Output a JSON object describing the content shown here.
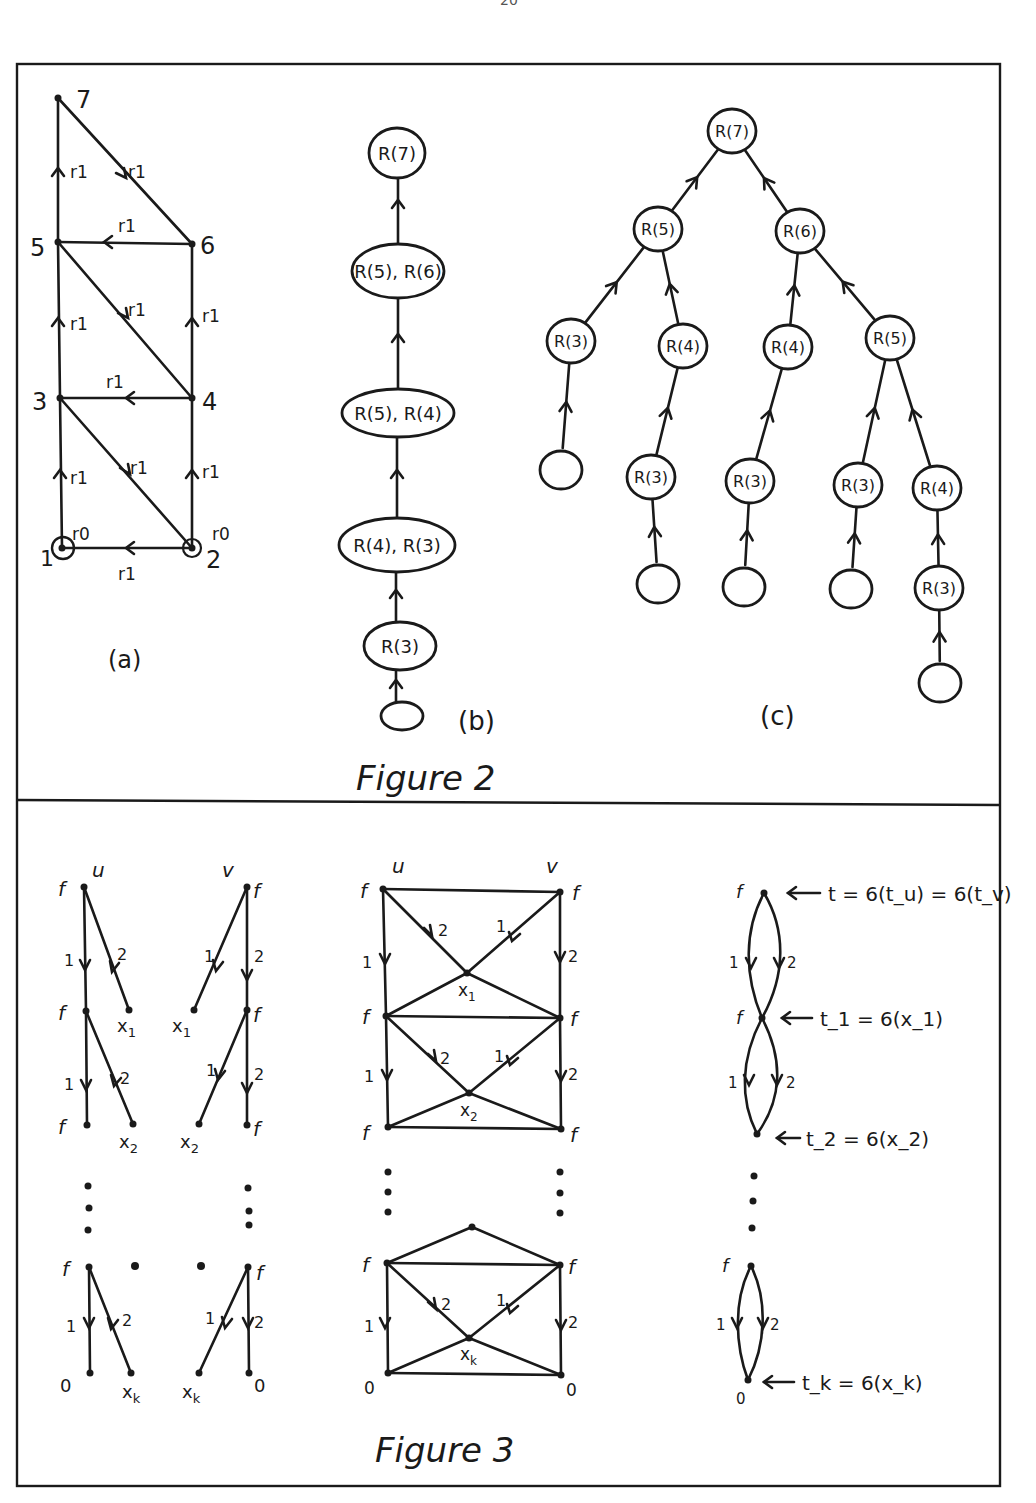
{
  "page_number": "20",
  "figure2": {
    "caption": "Figure 2",
    "a": {
      "label": "(a)",
      "nodes": [
        {
          "id": "1",
          "x": 62,
          "y": 548
        },
        {
          "id": "2",
          "x": 192,
          "y": 548
        },
        {
          "id": "3",
          "x": 60,
          "y": 398
        },
        {
          "id": "4",
          "x": 192,
          "y": 398
        },
        {
          "id": "5",
          "x": 58,
          "y": 242
        },
        {
          "id": "6",
          "x": 192,
          "y": 244
        },
        {
          "id": "7",
          "x": 58,
          "y": 98
        }
      ],
      "edge_label": "r1",
      "loop_label": "r0",
      "edges": [
        {
          "from": "1",
          "to": "3",
          "label": "r1"
        },
        {
          "from": "3",
          "to": "5",
          "label": "r1"
        },
        {
          "from": "5",
          "to": "7",
          "label": "r1"
        },
        {
          "from": "2",
          "to": "4",
          "label": "r1"
        },
        {
          "from": "4",
          "to": "6",
          "label": "r1"
        },
        {
          "from": "2",
          "to": "1",
          "label": "r1"
        },
        {
          "from": "4",
          "to": "3",
          "label": "r1"
        },
        {
          "from": "6",
          "to": "5",
          "label": "r1"
        },
        {
          "from": "3",
          "to": "2",
          "label": "r1"
        },
        {
          "from": "5",
          "to": "4",
          "label": "r1"
        },
        {
          "from": "7",
          "to": "6",
          "label": "r1"
        },
        {
          "from": "1",
          "to": "1",
          "label": "r0"
        },
        {
          "from": "2",
          "to": "2",
          "label": "r0"
        }
      ]
    },
    "b": {
      "label": "(b)",
      "nodes": [
        "R(7)",
        "R(5), R(6)",
        "R(5), R(4)",
        "R(4), R(3)",
        "R(3)",
        ""
      ]
    },
    "c": {
      "label": "(c)",
      "nodes": [
        {
          "id": "n0",
          "text": "R(7)",
          "x": 732,
          "y": 131
        },
        {
          "id": "n1",
          "text": "R(5)",
          "x": 658,
          "y": 229
        },
        {
          "id": "n2",
          "text": "R(6)",
          "x": 800,
          "y": 231
        },
        {
          "id": "n3",
          "text": "R(3)",
          "x": 571,
          "y": 341
        },
        {
          "id": "n4",
          "text": "R(4)",
          "x": 683,
          "y": 346
        },
        {
          "id": "n5",
          "text": "R(4)",
          "x": 788,
          "y": 347
        },
        {
          "id": "n6",
          "text": "R(5)",
          "x": 890,
          "y": 338
        },
        {
          "id": "n7",
          "text": "",
          "x": 561,
          "y": 470
        },
        {
          "id": "n8",
          "text": "R(3)",
          "x": 651,
          "y": 477
        },
        {
          "id": "n9",
          "text": "R(3)",
          "x": 750,
          "y": 481
        },
        {
          "id": "n10",
          "text": "R(3)",
          "x": 858,
          "y": 485
        },
        {
          "id": "n11",
          "text": "R(4)",
          "x": 937,
          "y": 488
        },
        {
          "id": "n12",
          "text": "",
          "x": 658,
          "y": 584
        },
        {
          "id": "n13",
          "text": "",
          "x": 744,
          "y": 587
        },
        {
          "id": "n14",
          "text": "",
          "x": 851,
          "y": 589
        },
        {
          "id": "n15",
          "text": "R(3)",
          "x": 939,
          "y": 588
        },
        {
          "id": "n16",
          "text": "",
          "x": 940,
          "y": 683
        }
      ],
      "edges": [
        [
          "n1",
          "n0"
        ],
        [
          "n2",
          "n0"
        ],
        [
          "n3",
          "n1"
        ],
        [
          "n4",
          "n1"
        ],
        [
          "n5",
          "n2"
        ],
        [
          "n6",
          "n2"
        ],
        [
          "n7",
          "n3"
        ],
        [
          "n8",
          "n4"
        ],
        [
          "n9",
          "n5"
        ],
        [
          "n10",
          "n6"
        ],
        [
          "n11",
          "n6"
        ],
        [
          "n12",
          "n8"
        ],
        [
          "n13",
          "n9"
        ],
        [
          "n14",
          "n10"
        ],
        [
          "n15",
          "n11"
        ],
        [
          "n16",
          "n15"
        ]
      ]
    }
  },
  "figure3": {
    "caption": "Figure 3",
    "labels": {
      "u": "u",
      "v": "v",
      "f": "f",
      "zero": "0",
      "x1": "x1",
      "x2": "x2",
      "xk": "xk",
      "edge1": "1",
      "edge2": "2"
    },
    "annotations": [
      "t = 6(t_u) = 6(t_v)",
      "t_1 = 6(x_1)",
      "t_2 = 6(x_2)",
      "t_k = 6(x_k)"
    ]
  }
}
